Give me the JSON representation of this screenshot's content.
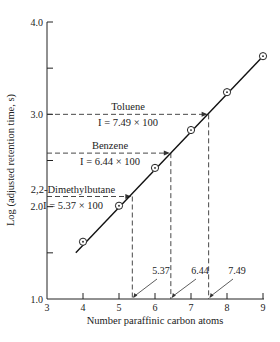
{
  "chart_data": {
    "type": "line",
    "title": "",
    "xlabel": "Number paraffinic carbon atoms",
    "ylabel": "Log (adjusted retention time, s)",
    "xlim": [
      3,
      9
    ],
    "ylim": [
      1.0,
      4.0
    ],
    "x_ticks": [
      3,
      4,
      5,
      6,
      7,
      8,
      9
    ],
    "x_tick_labels": [
      "3",
      "4",
      "5",
      "6",
      "7",
      "8",
      "9"
    ],
    "y_ticks": [
      1.0,
      1.5,
      2.0,
      2.5,
      3.0,
      3.5,
      4.0
    ],
    "y_tick_labels": [
      "1.0",
      "",
      "2.0",
      "",
      "3.0",
      "",
      "4.0"
    ],
    "grid": false,
    "series": [
      {
        "name": "n-paraffins",
        "x": [
          4,
          5,
          6,
          7,
          8,
          9
        ],
        "y": [
          1.62,
          2.01,
          2.42,
          2.83,
          3.24,
          3.63
        ],
        "marker": "circled-dot"
      }
    ],
    "fit_line": {
      "x": [
        3.8,
        9.0
      ],
      "y": [
        1.5,
        3.63
      ]
    },
    "annotations": [
      {
        "compound": "Toluene",
        "index_text": "I = 7.49 × 100",
        "log_rt": 3.0,
        "carbon_equiv": 7.49,
        "tick_label": "7.49"
      },
      {
        "compound": "Benzene",
        "index_text": "I = 6.44 × 100",
        "log_rt": 2.58,
        "carbon_equiv": 6.44,
        "tick_label": "6.44"
      },
      {
        "compound": "2,2-Dimethylbutane",
        "index_text": "I = 5.37 × 100",
        "log_rt": 2.11,
        "carbon_equiv": 5.37,
        "tick_label": "5.37"
      }
    ]
  }
}
